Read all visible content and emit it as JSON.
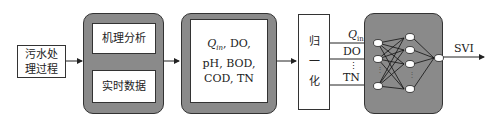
{
  "diagram": {
    "source_box": {
      "line1": "污水处",
      "line2": "理过程"
    },
    "analysis_group": {
      "top": "机理分析",
      "bottom": "实时数据"
    },
    "variables_box": {
      "line1_q": "Q",
      "line1_sub": "in",
      "line1_rest": ", DO,",
      "line2": "pH, BOD,",
      "line3": "COD, TN"
    },
    "normalize_box": {
      "c1": "归",
      "c2": "一",
      "c3": "化"
    },
    "inputs": {
      "q": "Q",
      "q_sub": "in",
      "do": "DO",
      "ellipsis": "⋮",
      "tn": "TN"
    },
    "network": {
      "hidden_ellipsis": "⋮",
      "input_ellipsis": "⋮"
    },
    "output": {
      "label": "SVI"
    }
  }
}
